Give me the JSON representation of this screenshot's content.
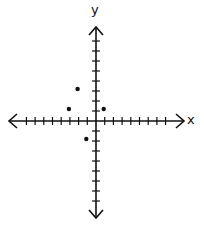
{
  "chart_data": {
    "type": "scatter",
    "title": "",
    "xlabel": "x",
    "ylabel": "y",
    "xlim": [
      -10,
      10
    ],
    "ylim": [
      -10,
      10
    ],
    "grid": false,
    "x_ticks_left": 8,
    "x_ticks_right": 8,
    "y_ticks_up": 8,
    "y_ticks_down": 8,
    "tick_labels": false,
    "points": [
      {
        "x": -2,
        "y": 3
      },
      {
        "x": -3,
        "y": 1
      },
      {
        "x": 1,
        "y": 1
      },
      {
        "x": -1,
        "y": -2
      }
    ],
    "legend": null
  },
  "style": {
    "axis_color": "#111111",
    "point_color": "#111111"
  }
}
